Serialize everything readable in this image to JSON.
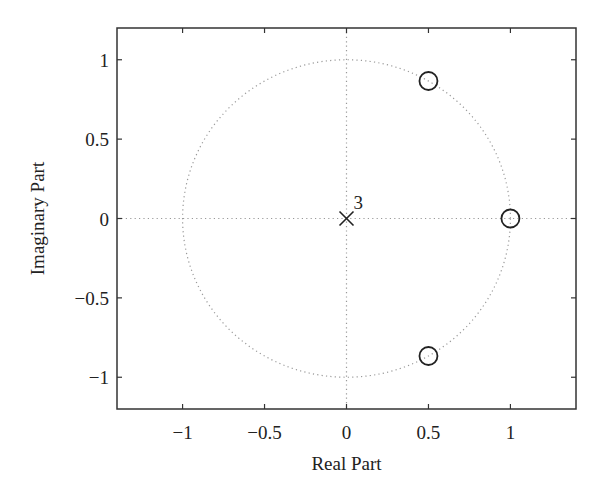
{
  "chart_data": {
    "type": "scatter",
    "subtype": "pole-zero plot",
    "title": "",
    "xlabel": "Real Part",
    "ylabel": "Imaginary Part",
    "xlim": [
      -1.4,
      1.4
    ],
    "ylim": [
      -1.2,
      1.2
    ],
    "xticks": [
      -1,
      -0.5,
      0,
      0.5,
      1
    ],
    "xtick_labels": [
      "−1",
      "−0.5",
      "0",
      "0.5",
      "1"
    ],
    "yticks": [
      -1,
      -0.5,
      0,
      0.5,
      1
    ],
    "ytick_labels": [
      "−1",
      "−0.5",
      "0",
      "0.5",
      "1"
    ],
    "grid": false,
    "unit_circle": true,
    "series": [
      {
        "name": "zeros",
        "marker": "circle",
        "points": [
          {
            "x": 1.0,
            "y": 0.0
          },
          {
            "x": 0.5,
            "y": 0.866
          },
          {
            "x": 0.5,
            "y": -0.866
          }
        ]
      },
      {
        "name": "poles",
        "marker": "x",
        "points": [
          {
            "x": 0.0,
            "y": 0.0,
            "multiplicity": 3
          }
        ]
      }
    ],
    "annotations": [
      {
        "text": "3",
        "x": 0.0,
        "y": 0.0,
        "note": "pole multiplicity"
      }
    ]
  },
  "colors": {
    "axes": "#333333",
    "markers": "#222222",
    "dotted": "#999999"
  }
}
